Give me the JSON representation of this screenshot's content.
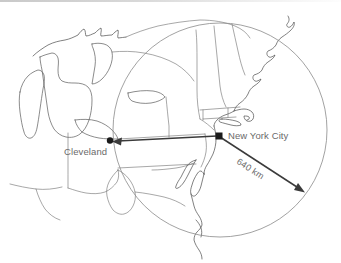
{
  "figure": {
    "type": "map",
    "width": 341,
    "height": 263,
    "background_color": "#ffffff"
  },
  "labels": {
    "origin_city": "New York City",
    "destination_city": "Cleveland",
    "distance": "640 km"
  },
  "markers": [
    {
      "name": "new-york-city",
      "label": "New York City",
      "shape": "square",
      "x": 219,
      "y": 136,
      "color": "#1a1a1a"
    },
    {
      "name": "cleveland",
      "label": "Cleveland",
      "shape": "dot",
      "x": 110,
      "y": 141,
      "color": "#1a1a1a"
    }
  ],
  "radius_circle": {
    "center_x": 220,
    "center_y": 130,
    "radius": 107,
    "stroke_color": "#8a8a8a",
    "represents": "640 km"
  },
  "vectors": [
    {
      "name": "nyc-to-cleveland",
      "from": "New York City",
      "to": "Cleveland",
      "from_x": 219,
      "from_y": 136,
      "to_x": 112,
      "to_y": 141,
      "has_arrowhead": true,
      "color": "#3b3b3b"
    },
    {
      "name": "nyc-radius-vector",
      "from": "New York City",
      "to": "circle edge",
      "from_x": 219,
      "from_y": 136,
      "to_x": 304,
      "to_y": 192,
      "label": "640 km",
      "has_arrowhead": true,
      "color": "#3b3b3b"
    }
  ],
  "colors": {
    "coastline": "#4a4a4a",
    "state_border": "#6d6d6d",
    "lake_outline": "#5a5a5a",
    "circle": "#8a8a8a",
    "text": "#6a6a6a",
    "marker": "#1a1a1a"
  }
}
